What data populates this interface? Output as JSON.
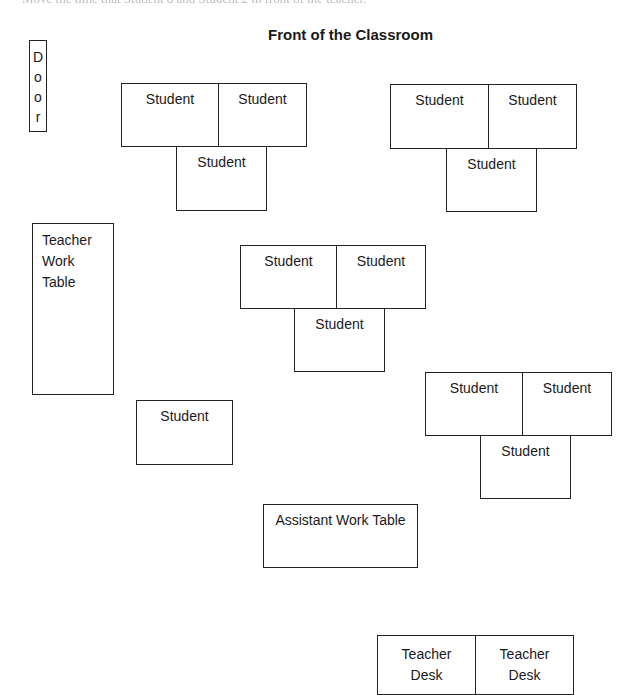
{
  "header": {
    "cutoff_text": "Move the time that Student 8 and Student 2 in front of the teacher.",
    "title": "Front of the Classroom"
  },
  "door": {
    "letters": [
      "D",
      "o",
      "o",
      "r"
    ]
  },
  "teacher_work_table": {
    "lines": [
      "Teacher",
      "Work",
      "Table"
    ]
  },
  "student_clusters": [
    {
      "seats": [
        {
          "label": "Student"
        },
        {
          "label": "Student"
        },
        {
          "label": "Student"
        }
      ]
    },
    {
      "seats": [
        {
          "label": "Student"
        },
        {
          "label": "Student"
        },
        {
          "label": "Student"
        }
      ]
    },
    {
      "seats": [
        {
          "label": "Student"
        },
        {
          "label": "Student"
        },
        {
          "label": "Student"
        }
      ]
    },
    {
      "seats": [
        {
          "label": "Student"
        },
        {
          "label": "Student"
        },
        {
          "label": "Student"
        }
      ]
    }
  ],
  "single_student": {
    "label": "Student"
  },
  "assistant_work_table": {
    "label": "Assistant Work Table"
  },
  "teacher_desks": [
    {
      "lines": [
        "Teacher",
        "Desk"
      ]
    },
    {
      "lines": [
        "Teacher",
        "Desk"
      ]
    }
  ]
}
